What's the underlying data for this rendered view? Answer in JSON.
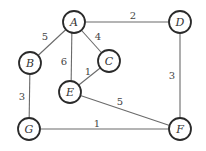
{
  "graph": {
    "nodes": {
      "A": {
        "label": "A"
      },
      "B": {
        "label": "B"
      },
      "C": {
        "label": "C"
      },
      "D": {
        "label": "D"
      },
      "E": {
        "label": "E"
      },
      "F": {
        "label": "F"
      },
      "G": {
        "label": "G"
      }
    },
    "edges": {
      "AB": {
        "from": "A",
        "to": "B",
        "weight": "5"
      },
      "AD": {
        "from": "A",
        "to": "D",
        "weight": "2"
      },
      "AE": {
        "from": "A",
        "to": "E",
        "weight": "6"
      },
      "AC": {
        "from": "A",
        "to": "C",
        "weight": "4"
      },
      "CE": {
        "from": "C",
        "to": "E",
        "weight": "1"
      },
      "DF": {
        "from": "D",
        "to": "F",
        "weight": "3"
      },
      "EF": {
        "from": "E",
        "to": "F",
        "weight": "5"
      },
      "BG": {
        "from": "B",
        "to": "G",
        "weight": "3"
      },
      "GF": {
        "from": "G",
        "to": "F",
        "weight": "1"
      }
    }
  }
}
